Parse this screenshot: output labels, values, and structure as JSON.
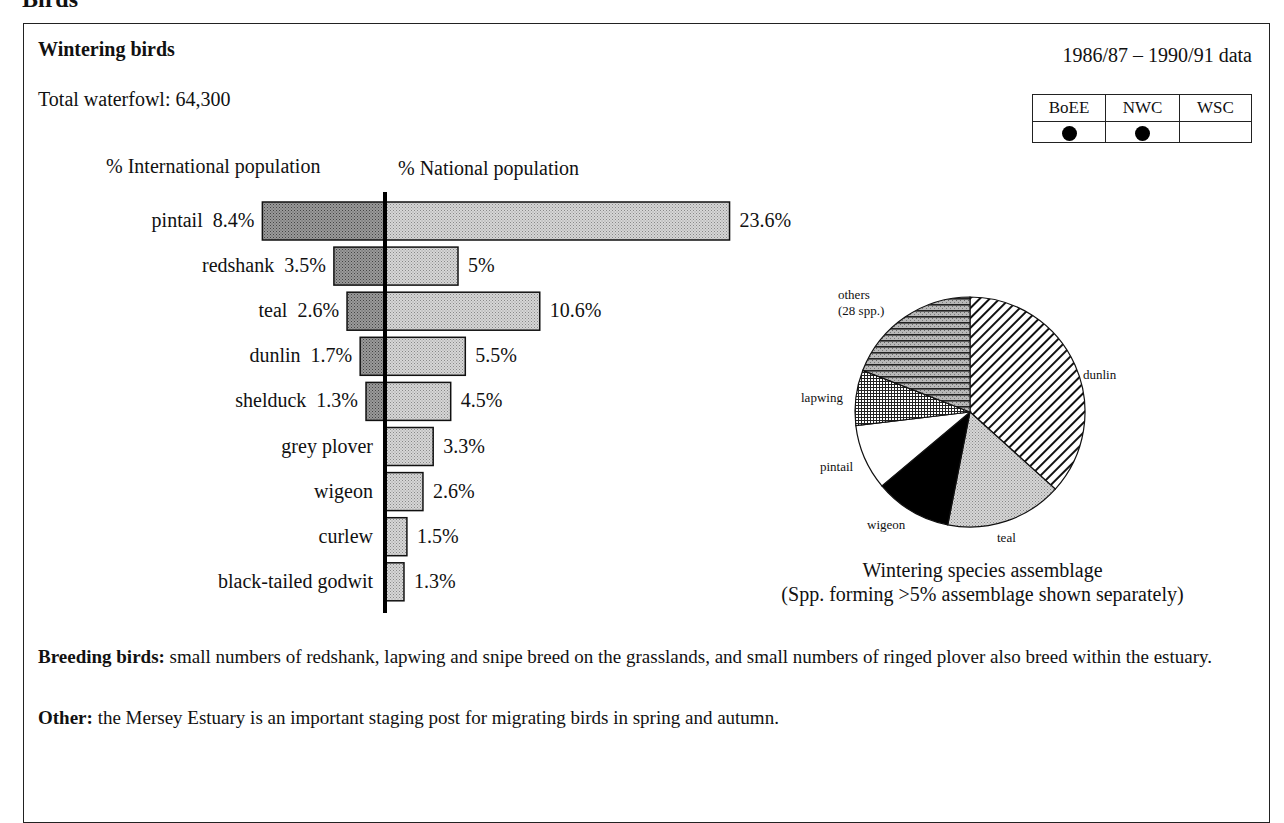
{
  "section_heading": "Birds",
  "box": {
    "title": "Wintering birds",
    "total_label": "Total waterfowl: 64,300",
    "date_range": "1986/87 – 1990/91 data",
    "source_table": {
      "headers": [
        "BoEE",
        "NWC",
        "WSC"
      ],
      "marks": [
        true,
        true,
        false
      ]
    }
  },
  "bar_chart": {
    "intl_header": "% International population",
    "natl_header": "% National population"
  },
  "pie_chart": {
    "caption_line1": "Wintering species assemblage",
    "caption_line2": "(Spp. forming >5% assemblage shown separately)"
  },
  "notes": {
    "breeding_label": "Breeding birds:",
    "breeding_text": " small numbers of redshank, lapwing and snipe breed on the grasslands, and small numbers of ringed plover also breed within the estuary.",
    "other_label": "Other:",
    "other_text": " the Mersey Estuary is an important staging post for migrating birds in spring and autumn."
  },
  "colors": {
    "ink": "#111111",
    "intl_fill": "#7a7a7a",
    "natl_fill": "#c8c8c8",
    "frame": "#222222"
  },
  "chart_data": [
    {
      "type": "bar",
      "title": "Wintering birds",
      "orientation": "horizontal-diverging",
      "categories": [
        "pintail",
        "redshank",
        "teal",
        "dunlin",
        "shelduck",
        "grey plover",
        "wigeon",
        "curlew",
        "black-tailed godwit"
      ],
      "series": [
        {
          "name": "% International population",
          "direction": "left",
          "values": [
            8.4,
            3.5,
            2.6,
            1.7,
            1.3,
            null,
            null,
            null,
            null
          ],
          "labels": [
            "8.4%",
            "3.5%",
            "2.6%",
            "1.7%",
            "1.3%",
            "",
            "",
            "",
            ""
          ]
        },
        {
          "name": "% National population",
          "direction": "right",
          "values": [
            23.6,
            5,
            10.6,
            5.5,
            4.5,
            3.3,
            2.6,
            1.5,
            1.3
          ],
          "labels": [
            "23.6%",
            "5%",
            "10.6%",
            "5.5%",
            "4.5%",
            "3.3%",
            "2.6%",
            "1.5%",
            "1.3%"
          ]
        }
      ],
      "xlabel": "",
      "ylabel": "",
      "grid": false
    },
    {
      "type": "pie",
      "title": "Wintering species assemblage",
      "subtitle": "(Spp. forming >5% assemblage shown separately)",
      "start_angle": "12 o'clock, clockwise",
      "slices": [
        {
          "label": "dunlin",
          "value": 36.7,
          "pattern": "diagonal-hatch"
        },
        {
          "label": "teal",
          "value": 16.4,
          "pattern": "fine-stipple"
        },
        {
          "label": "wigeon",
          "value": 10.8,
          "pattern": "solid-black"
        },
        {
          "label": "pintail",
          "value": 9.2,
          "pattern": "white"
        },
        {
          "label": "lapwing",
          "value": 7.8,
          "pattern": "crosshatch"
        },
        {
          "label": "others\n(28 spp.)",
          "value": 19.1,
          "pattern": "horizontal-lines"
        }
      ],
      "slice_label_lines": {
        "others_line1": "others",
        "others_line2": "(28 spp.)"
      }
    }
  ]
}
